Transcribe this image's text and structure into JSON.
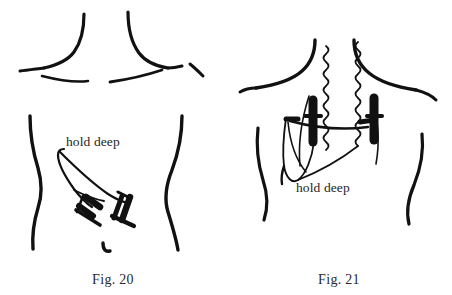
{
  "sheet": {
    "background_color": "#ffffff",
    "ink_color": "#111111",
    "width": 452,
    "height": 295,
    "style": "black ink line drawing, patent figure"
  },
  "figures": [
    {
      "id": "fig-20",
      "caption": "Fig. 20",
      "view": "anterior torso, neck and clavicles",
      "annotation": "hold deep",
      "elements": [
        "neck-left-contour",
        "neck-right-contour",
        "shoulder-left-contour",
        "shoulder-right-contour",
        "clavicle-left-curve",
        "clavicle-right-curve",
        "torso-left-contour",
        "torso-right-contour",
        "incision-flap-hook",
        "surgical-clamp-left",
        "surgical-clamp-right",
        "navel-mark"
      ],
      "instrument_count": 2,
      "instrument_type": "clamp"
    },
    {
      "id": "fig-21",
      "caption": "Fig. 21",
      "view": "anterior torso, neck and clavicles",
      "annotation": "hold deep",
      "elements": [
        "neck-left-contour",
        "neck-right-contour",
        "shoulder-left-contour",
        "shoulder-right-contour",
        "torso-left-contour",
        "torso-right-contour",
        "suture-thread-left",
        "suture-thread-right",
        "retractor-bar-left",
        "retractor-bar-right",
        "retractor-cross-arm",
        "tissue-flap-teardrop"
      ],
      "instrument_count": 2,
      "instrument_type": "retractor-bar"
    }
  ]
}
